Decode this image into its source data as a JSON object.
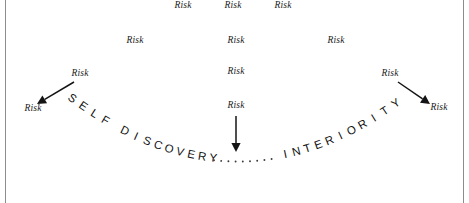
{
  "figure": {
    "background_color": "#ffffff",
    "border_color": "#8c8c8c",
    "text_color": "#111111"
  },
  "risk_labels": [
    {
      "text": "Risk",
      "x": 183,
      "y": 6
    },
    {
      "text": "Risk",
      "x": 233,
      "y": 6
    },
    {
      "text": "Risk",
      "x": 283,
      "y": 6
    },
    {
      "text": "Risk",
      "x": 135,
      "y": 41
    },
    {
      "text": "Risk",
      "x": 236,
      "y": 41
    },
    {
      "text": "Risk",
      "x": 336,
      "y": 41
    },
    {
      "text": "Risk",
      "x": 80,
      "y": 74
    },
    {
      "text": "Risk",
      "x": 236,
      "y": 72
    },
    {
      "text": "Risk",
      "x": 390,
      "y": 74
    },
    {
      "text": "Risk",
      "x": 33,
      "y": 109
    },
    {
      "text": "Risk",
      "x": 236,
      "y": 106
    },
    {
      "text": "Risk",
      "x": 439,
      "y": 108
    }
  ],
  "arc_text": {
    "left_word": "SELF DISCOVERY",
    "separator_dots": 9,
    "right_word": "INTERIORITY",
    "full_text": "SELF DISCOVERY.........INTERIORITY"
  },
  "arrows": [
    {
      "name": "left-arrow",
      "direction": "down-left",
      "from_x": 74,
      "from_y": 82,
      "to_x": 37,
      "to_y": 104
    },
    {
      "name": "center-arrow",
      "direction": "down",
      "from_x": 236,
      "from_y": 116,
      "to_x": 236,
      "to_y": 152
    },
    {
      "name": "right-arrow",
      "direction": "down-right",
      "from_x": 398,
      "from_y": 82,
      "to_x": 430,
      "to_y": 104
    }
  ]
}
